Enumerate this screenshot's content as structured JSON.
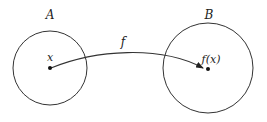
{
  "diagram": {
    "sets": [
      {
        "id": "A",
        "label": "A",
        "cx": 50,
        "cy": 68,
        "r": 37,
        "label_x": 50,
        "label_y": 19
      },
      {
        "id": "B",
        "label": "B",
        "cx": 208,
        "cy": 68,
        "r": 45,
        "label_x": 209,
        "label_y": 19
      }
    ],
    "points": [
      {
        "id": "x",
        "label": "x",
        "cx": 50,
        "cy": 68,
        "label_x": 50,
        "label_y": 61
      },
      {
        "id": "fx",
        "label": "f(x)",
        "cx": 208,
        "cy": 69,
        "label_x": 211,
        "label_y": 63
      }
    ],
    "arrow": {
      "label": "f",
      "label_x": 123,
      "label_y": 46,
      "path": "M 51 68 C 95 50, 160 45, 203 68"
    },
    "colors": {
      "stroke": "#333333",
      "text": "#222222",
      "background": "#ffffff"
    }
  }
}
